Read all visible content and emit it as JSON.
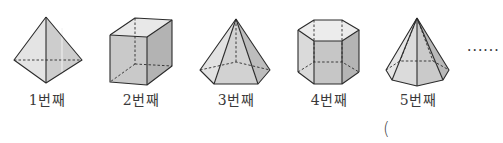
{
  "figure": {
    "items": [
      {
        "index": 1,
        "label": "1번째",
        "shape": "square-pyramid-bipyramid-view",
        "kind": "pyramid"
      },
      {
        "index": 2,
        "label": "2번째",
        "shape": "quadrangular-prism",
        "kind": "prism"
      },
      {
        "index": 3,
        "label": "3번째",
        "shape": "hexagonal-pyramid",
        "kind": "pyramid"
      },
      {
        "index": 4,
        "label": "4번째",
        "shape": "hexagonal-prism",
        "kind": "prism"
      },
      {
        "index": 5,
        "label": "5번째",
        "shape": "heptagonal-pyramid",
        "kind": "pyramid"
      }
    ],
    "continuation": "······",
    "answer_blank": "("
  },
  "colors": {
    "stroke": "#2b2b2b",
    "face_light": "#e6e6e6",
    "face_mid": "#cfcfcf",
    "face_dark": "#b8b8b8",
    "text": "#3a3a3a"
  }
}
